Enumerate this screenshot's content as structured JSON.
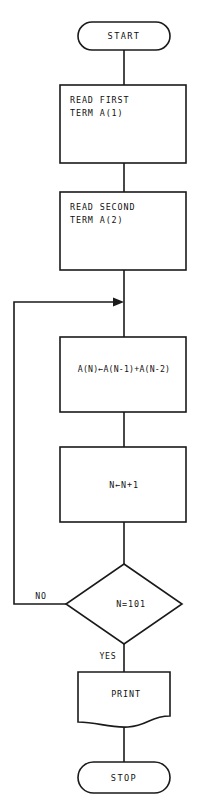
{
  "diagram": {
    "background_color": "#ffffff",
    "line_color": "#1a1a1a",
    "text_color": "#111111"
  },
  "nodes": {
    "start": {
      "label": "START",
      "shape": "terminator"
    },
    "read_first": {
      "line1": "READ FIRST",
      "line2": "TERM A(1)",
      "shape": "process"
    },
    "read_second": {
      "line1": "READ SECOND",
      "line2": "TERM A(2)",
      "shape": "process"
    },
    "compute": {
      "label": "A(N)←A(N-1)+A(N-2)",
      "shape": "process"
    },
    "increment": {
      "label": "N←N+1",
      "shape": "process"
    },
    "decision": {
      "label": "N=101",
      "shape": "decision"
    },
    "print": {
      "label": "PRINT",
      "shape": "document"
    },
    "stop": {
      "label": "STOP",
      "shape": "terminator"
    }
  },
  "branches": {
    "no_label": "NO",
    "yes_label": "YES"
  }
}
